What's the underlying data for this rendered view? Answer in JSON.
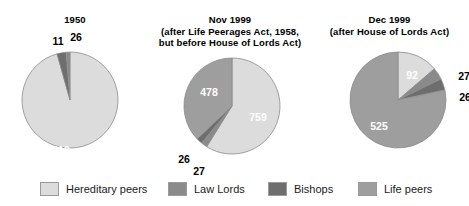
{
  "colors": {
    "hereditary": "#dcdcdc",
    "law_lords": "#8a8a8a",
    "bishops": "#6e6e6e",
    "life": "#9e9e9e",
    "stroke": "#8c8c8c",
    "label_inside": "#ffffff",
    "label_outside": "#000000",
    "background": "#ffffff"
  },
  "legend": {
    "items": [
      {
        "label": "Hereditary peers",
        "key": "hereditary",
        "color": "#dcdcdc"
      },
      {
        "label": "Law Lords",
        "key": "law_lords",
        "color": "#8a8a8a"
      },
      {
        "label": "Bishops",
        "key": "bishops",
        "color": "#6e6e6e"
      },
      {
        "label": "Life peers",
        "key": "life",
        "color": "#9e9e9e"
      }
    ]
  },
  "panels": [
    {
      "title_lines": [
        "1950"
      ],
      "title_line_0": "1950",
      "title_line_1": "",
      "title_line_2": "",
      "labels": {
        "l0": "810",
        "l1": "26",
        "l2": "11",
        "l3": ""
      }
    },
    {
      "title_lines": [
        "Nov 1999",
        "(after Life Peerages Act, 1958,",
        "but before House of Lords Act)"
      ],
      "title_line_0": "Nov 1999",
      "title_line_1": "(after Life Peerages Act, 1958,",
      "title_line_2": "but before House of Lords Act)",
      "labels": {
        "l0": "759",
        "l1": "27",
        "l2": "26",
        "l3": "478"
      }
    },
    {
      "title_lines": [
        "Dec 1999",
        "(after House of Lords Act)"
      ],
      "title_line_0": "Dec 1999",
      "title_line_1": "(after House of Lords Act)",
      "title_line_2": "",
      "labels": {
        "l0": "92",
        "l1": "27",
        "l2": "26",
        "l3": "525"
      }
    }
  ],
  "chart_data": [
    {
      "type": "pie",
      "title": "1950",
      "subtitle": "",
      "categories": [
        "Hereditary peers",
        "Bishops",
        "Law Lords"
      ],
      "values": [
        810,
        26,
        11
      ],
      "total": 847,
      "colors": [
        "#dcdcdc",
        "#6e6e6e",
        "#8a8a8a"
      ],
      "label_positions": [
        "inside",
        "outside",
        "outside"
      ],
      "legend_position": "bottom",
      "grid": false
    },
    {
      "type": "pie",
      "title": "Nov 1999",
      "subtitle": "(after Life Peerages Act, 1958, but before House of Lords Act)",
      "categories": [
        "Hereditary peers",
        "Law Lords",
        "Bishops",
        "Life peers"
      ],
      "values": [
        759,
        27,
        26,
        478
      ],
      "total": 1290,
      "colors": [
        "#dcdcdc",
        "#8a8a8a",
        "#6e6e6e",
        "#9e9e9e"
      ],
      "label_positions": [
        "inside",
        "outside",
        "outside",
        "inside"
      ],
      "legend_position": "bottom",
      "grid": false
    },
    {
      "type": "pie",
      "title": "Dec 1999",
      "subtitle": "(after House of Lords Act)",
      "categories": [
        "Hereditary peers",
        "Law Lords",
        "Bishops",
        "Life peers"
      ],
      "values": [
        92,
        27,
        26,
        525
      ],
      "total": 670,
      "colors": [
        "#dcdcdc",
        "#8a8a8a",
        "#6e6e6e",
        "#9e9e9e"
      ],
      "label_positions": [
        "inside",
        "outside",
        "outside",
        "inside"
      ],
      "legend_position": "bottom",
      "grid": false
    }
  ]
}
